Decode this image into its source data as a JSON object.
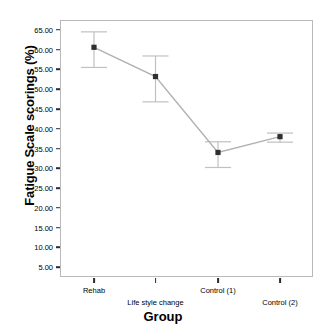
{
  "chart_data": {
    "type": "line",
    "title": "",
    "xlabel": "Group",
    "ylabel": "Fatigue Scale scorings (%)",
    "categories": [
      "Rehab",
      "Life style change",
      "Control (1)",
      "Control (2)"
    ],
    "values": [
      60.6,
      53.2,
      34.0,
      38.0
    ],
    "error_upper": [
      64.5,
      58.4,
      36.7,
      38.9
    ],
    "error_lower": [
      55.5,
      46.8,
      30.2,
      36.6
    ],
    "ylim": [
      2.5,
      67.5
    ],
    "ytick_labels": [
      "5.00",
      "10.00",
      "15.00",
      "20.00",
      "25.00",
      "30.00",
      "35.00",
      "40.00",
      "45.00",
      "50.00",
      "55.00",
      "60.00",
      "65.00"
    ],
    "ytick_values": [
      5,
      10,
      15,
      20,
      25,
      30,
      35,
      40,
      45,
      50,
      55,
      60,
      65
    ],
    "grid": false,
    "legend": "none",
    "series": [
      {
        "name": "Fatigue Scale scorings (%)",
        "values": [
          60.6,
          53.2,
          34.0,
          38.0
        ]
      }
    ],
    "colors": {
      "line": "#b0b0b0",
      "marker": "#2f2f2f",
      "error_bar": "#c0c0c0",
      "axis": "#b9b9b9",
      "text": "#000000"
    }
  }
}
